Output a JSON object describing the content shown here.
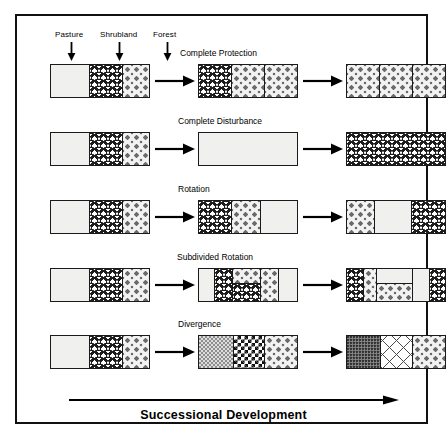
{
  "figure": {
    "caption": "Successional Development",
    "legend": {
      "items": [
        {
          "label": "Pasture",
          "icon": "down-arrow-icon"
        },
        {
          "label": "Shrubland",
          "icon": "down-arrow-icon"
        },
        {
          "label": "Forest",
          "icon": "down-arrow-icon"
        }
      ]
    },
    "flow_icon": "right-arrow-icon",
    "summary_icon": "long-right-arrow-icon",
    "rows": [
      {
        "title": "Complete Protection",
        "stages": [
          {
            "segments": [
              {
                "fill": "pasture"
              },
              {
                "fill": "shrubland"
              },
              {
                "fill": "forest"
              }
            ]
          },
          {
            "segments": [
              {
                "fill": "shrubland"
              },
              {
                "fill": "forest"
              },
              {
                "fill": "forest"
              }
            ]
          },
          {
            "segments": [
              {
                "fill": "forest"
              },
              {
                "fill": "forest"
              },
              {
                "fill": "forest"
              }
            ]
          }
        ]
      },
      {
        "title": "Complete Disturbance",
        "stages": [
          {
            "segments": [
              {
                "fill": "pasture"
              },
              {
                "fill": "shrubland"
              },
              {
                "fill": "forest"
              }
            ]
          },
          {
            "segments": [
              {
                "fill": "pasture"
              }
            ]
          },
          {
            "segments": [
              {
                "fill": "shrubland"
              }
            ]
          }
        ]
      },
      {
        "title": "Rotation",
        "stages": [
          {
            "segments": [
              {
                "fill": "pasture"
              },
              {
                "fill": "shrubland"
              },
              {
                "fill": "forest"
              }
            ]
          },
          {
            "segments": [
              {
                "fill": "shrubland"
              },
              {
                "fill": "forest"
              },
              {
                "fill": "pasture"
              }
            ]
          },
          {
            "segments": [
              {
                "fill": "forest"
              },
              {
                "fill": "pasture"
              },
              {
                "fill": "shrubland"
              }
            ]
          }
        ]
      },
      {
        "title": "Subdivided  Rotation",
        "stages": [
          {
            "segments": [
              {
                "fill": "pasture"
              },
              {
                "fill": "shrubland"
              },
              {
                "fill": "forest"
              }
            ]
          },
          {
            "segments": [
              {
                "fill": "pasture"
              },
              {
                "fill": "shrubland"
              },
              {
                "fill": "split",
                "sub": [
                  "forest",
                  "shrubland"
                ]
              },
              {
                "fill": "forest"
              },
              {
                "fill": "pasture"
              }
            ]
          },
          {
            "segments": [
              {
                "fill": "shrubland"
              },
              {
                "fill": "forest"
              },
              {
                "fill": "split",
                "sub": [
                  "pasture",
                  "forest"
                ]
              },
              {
                "fill": "pasture"
              },
              {
                "fill": "shrubland"
              }
            ]
          }
        ]
      },
      {
        "title": "Divergence",
        "stages": [
          {
            "segments": [
              {
                "fill": "pasture"
              },
              {
                "fill": "shrubland"
              },
              {
                "fill": "forest"
              }
            ]
          },
          {
            "segments": [
              {
                "fill": "div-a"
              },
              {
                "fill": "div-b"
              },
              {
                "fill": "forest"
              }
            ]
          },
          {
            "segments": [
              {
                "fill": "div-c"
              },
              {
                "fill": "div-d"
              },
              {
                "fill": "forest"
              }
            ]
          }
        ]
      }
    ]
  }
}
